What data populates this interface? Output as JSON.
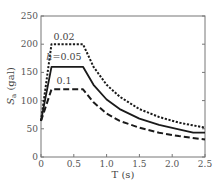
{
  "chart_data": {
    "type": "line",
    "title": "",
    "xlabel": "T (s)",
    "ylabel": "S_a (gal)",
    "xlim": [
      0,
      2.5
    ],
    "ylim": [
      0,
      250
    ],
    "x_ticks": [
      0,
      0.5,
      1.0,
      1.5,
      2.0,
      2.5
    ],
    "x_tick_labels": [
      "0",
      "0.5",
      "1.0",
      "1.5",
      "2.0",
      "2.5"
    ],
    "y_ticks": [
      0,
      50,
      100,
      150,
      200,
      250
    ],
    "y_tick_labels": [
      "0",
      "50",
      "100",
      "150",
      "200",
      "250"
    ],
    "grid": false,
    "legend": "inline annotations",
    "annotations": [
      {
        "text": "0.02",
        "x": 0.35,
        "y": 207
      },
      {
        "text": "h=0.05",
        "x": 0.35,
        "y": 172
      },
      {
        "text": "0.1",
        "x": 0.35,
        "y": 130
      }
    ],
    "series": [
      {
        "name": "h=0.02",
        "style": "dotted",
        "x": [
          0,
          0.16,
          0.64,
          0.8,
          1.0,
          1.2,
          1.5,
          1.8,
          2.1,
          2.5
        ],
        "y": [
          64,
          200,
          200,
          160,
          128,
          107,
          85,
          71,
          61,
          52
        ]
      },
      {
        "name": "h=0.05",
        "style": "solid",
        "x": [
          0,
          0.16,
          0.64,
          0.8,
          1.0,
          1.2,
          1.5,
          1.8,
          2.1,
          2.32,
          2.5
        ],
        "y": [
          64,
          160,
          160,
          128,
          102,
          85,
          68,
          57,
          49,
          43,
          43
        ]
      },
      {
        "name": "h=0.1",
        "style": "dashed",
        "x": [
          0,
          0.16,
          0.64,
          0.8,
          1.0,
          1.2,
          1.5,
          1.8,
          2.1,
          2.5
        ],
        "y": [
          64,
          120,
          120,
          97,
          77,
          64,
          52,
          43,
          37,
          31
        ]
      }
    ]
  },
  "labels": {
    "x_axis": "T (s)",
    "y_axis_main": "S",
    "y_axis_sub": "a",
    "y_axis_unit": " (gal)"
  }
}
